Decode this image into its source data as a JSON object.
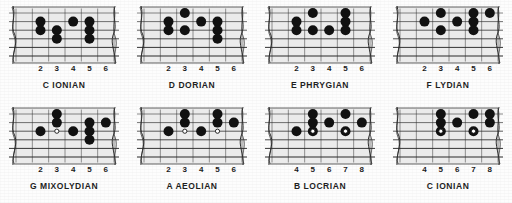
{
  "sheet": {
    "title": "Guitar Modes Fretboard Diagrams",
    "colors": {
      "ink": "#121212",
      "paper": "#fdfdfd",
      "string": "#2a2a2a",
      "fretline": "#6e6e6e",
      "dot_fill": "#111111",
      "dot_open_fill": "#ffffff",
      "dot_open_stroke": "#111111"
    },
    "grid": {
      "columns": 4,
      "rows": 2,
      "strings": 6,
      "fret_slots": 6
    }
  },
  "diagrams": [
    {
      "id": "c-ionian-top",
      "caption": "C IONIAN",
      "fret_numbers": [
        "2",
        "3",
        "4",
        "5",
        "6"
      ],
      "dots": [
        {
          "string": 1,
          "slot": 1,
          "type": "filled"
        },
        {
          "string": 2,
          "slot": 1,
          "type": "filled"
        },
        {
          "string": 2,
          "slot": 2,
          "type": "filled"
        },
        {
          "string": 3,
          "slot": 2,
          "type": "filled"
        },
        {
          "string": 1,
          "slot": 3,
          "type": "filled"
        },
        {
          "string": 1,
          "slot": 4,
          "type": "filled"
        },
        {
          "string": 2,
          "slot": 4,
          "type": "filled"
        },
        {
          "string": 3,
          "slot": 4,
          "type": "filled"
        }
      ]
    },
    {
      "id": "d-dorian",
      "caption": "D DORIAN",
      "fret_numbers": [
        "2",
        "3",
        "4",
        "5",
        "6"
      ],
      "dots": [
        {
          "string": 0,
          "slot": 2,
          "type": "filled"
        },
        {
          "string": 1,
          "slot": 1,
          "type": "filled"
        },
        {
          "string": 2,
          "slot": 1,
          "type": "filled"
        },
        {
          "string": 2,
          "slot": 2,
          "type": "filled"
        },
        {
          "string": 1,
          "slot": 3,
          "type": "filled"
        },
        {
          "string": 1,
          "slot": 4,
          "type": "filled"
        },
        {
          "string": 2,
          "slot": 4,
          "type": "filled"
        },
        {
          "string": 3,
          "slot": 4,
          "type": "filled"
        }
      ]
    },
    {
      "id": "e-phrygian",
      "caption": "E PHRYGIAN",
      "fret_numbers": [
        "2",
        "3",
        "4",
        "5",
        "6"
      ],
      "dots": [
        {
          "string": 0,
          "slot": 2,
          "type": "filled"
        },
        {
          "string": 1,
          "slot": 1,
          "type": "filled"
        },
        {
          "string": 2,
          "slot": 1,
          "type": "filled"
        },
        {
          "string": 2,
          "slot": 2,
          "type": "filled"
        },
        {
          "string": 2,
          "slot": 3,
          "type": "filled"
        },
        {
          "string": 0,
          "slot": 4,
          "type": "filled"
        },
        {
          "string": 1,
          "slot": 4,
          "type": "filled"
        },
        {
          "string": 2,
          "slot": 4,
          "type": "filled"
        }
      ]
    },
    {
      "id": "f-lydian",
      "caption": "F LYDIAN",
      "fret_numbers": [
        "2",
        "3",
        "4",
        "5",
        "6"
      ],
      "dots": [
        {
          "string": 0,
          "slot": 2,
          "type": "filled"
        },
        {
          "string": 1,
          "slot": 1,
          "type": "filled"
        },
        {
          "string": 2,
          "slot": 2,
          "type": "filled"
        },
        {
          "string": 1,
          "slot": 3,
          "type": "filled"
        },
        {
          "string": 0,
          "slot": 4,
          "type": "filled"
        },
        {
          "string": 1,
          "slot": 4,
          "type": "filled"
        },
        {
          "string": 2,
          "slot": 4,
          "type": "filled"
        },
        {
          "string": 0,
          "slot": 5,
          "type": "filled"
        }
      ]
    },
    {
      "id": "g-mixolydian",
      "caption": "G MIXOLYDIAN",
      "fret_numbers": [
        "2",
        "3",
        "4",
        "5",
        "6"
      ],
      "dots": [
        {
          "string": 0,
          "slot": 2,
          "type": "filled"
        },
        {
          "string": 1,
          "slot": 2,
          "type": "filled"
        },
        {
          "string": 2,
          "slot": 1,
          "type": "filled"
        },
        {
          "string": 2,
          "slot": 2,
          "type": "open"
        },
        {
          "string": 2,
          "slot": 3,
          "type": "filled"
        },
        {
          "string": 1,
          "slot": 4,
          "type": "filled"
        },
        {
          "string": 2,
          "slot": 4,
          "type": "filled"
        },
        {
          "string": 3,
          "slot": 4,
          "type": "filled"
        },
        {
          "string": 1,
          "slot": 5,
          "type": "filled"
        }
      ]
    },
    {
      "id": "a-aeolian",
      "caption": "A AEOLIAN",
      "fret_numbers": [
        "2",
        "3",
        "4",
        "5",
        "6"
      ],
      "dots": [
        {
          "string": 0,
          "slot": 2,
          "type": "filled"
        },
        {
          "string": 1,
          "slot": 2,
          "type": "filled"
        },
        {
          "string": 2,
          "slot": 1,
          "type": "filled"
        },
        {
          "string": 2,
          "slot": 2,
          "type": "open"
        },
        {
          "string": 2,
          "slot": 3,
          "type": "filled"
        },
        {
          "string": 0,
          "slot": 4,
          "type": "filled"
        },
        {
          "string": 1,
          "slot": 4,
          "type": "filled"
        },
        {
          "string": 2,
          "slot": 4,
          "type": "open"
        },
        {
          "string": 1,
          "slot": 5,
          "type": "filled"
        }
      ]
    },
    {
      "id": "b-locrian",
      "caption": "B LOCRIAN",
      "fret_numbers": [
        "4",
        "5",
        "6",
        "7",
        "8"
      ],
      "dots": [
        {
          "string": 0,
          "slot": 2,
          "type": "filled"
        },
        {
          "string": 1,
          "slot": 2,
          "type": "filled"
        },
        {
          "string": 2,
          "slot": 1,
          "type": "filled"
        },
        {
          "string": 2,
          "slot": 2,
          "type": "filled"
        },
        {
          "string": 2,
          "slot": 2,
          "type": "open"
        },
        {
          "string": 1,
          "slot": 3,
          "type": "filled"
        },
        {
          "string": 0,
          "slot": 4,
          "type": "filled"
        },
        {
          "string": 2,
          "slot": 4,
          "type": "filled"
        },
        {
          "string": 2,
          "slot": 4,
          "type": "open"
        },
        {
          "string": 1,
          "slot": 5,
          "type": "filled"
        }
      ]
    },
    {
      "id": "c-ionian-bottom",
      "caption": "C IONIAN",
      "fret_numbers": [
        "4",
        "5",
        "6",
        "7",
        "8"
      ],
      "dots": [
        {
          "string": 0,
          "slot": 2,
          "type": "filled"
        },
        {
          "string": 1,
          "slot": 2,
          "type": "filled"
        },
        {
          "string": 2,
          "slot": 2,
          "type": "filled"
        },
        {
          "string": 2,
          "slot": 2,
          "type": "open"
        },
        {
          "string": 1,
          "slot": 3,
          "type": "filled"
        },
        {
          "string": 0,
          "slot": 4,
          "type": "filled"
        },
        {
          "string": 2,
          "slot": 4,
          "type": "filled"
        },
        {
          "string": 2,
          "slot": 4,
          "type": "open"
        },
        {
          "string": 0,
          "slot": 5,
          "type": "filled"
        },
        {
          "string": 1,
          "slot": 5,
          "type": "filled"
        }
      ]
    }
  ]
}
